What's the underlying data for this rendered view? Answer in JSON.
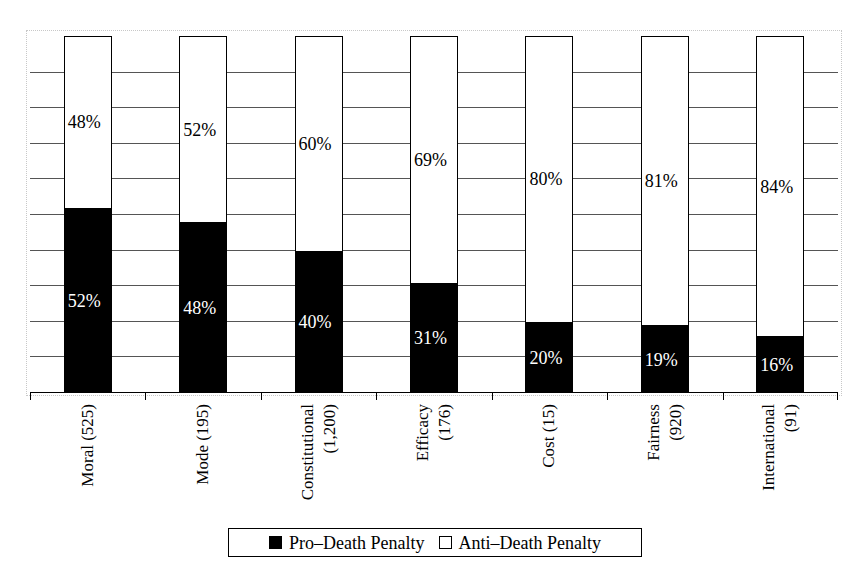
{
  "chart_data": {
    "type": "bar",
    "subtype": "stacked-100-percent",
    "title": "",
    "subtitle": "",
    "xlabel": "",
    "ylabel": "",
    "ylim": [
      0,
      100
    ],
    "grid": true,
    "gridlines": [
      10,
      20,
      30,
      40,
      50,
      60,
      70,
      80,
      90
    ],
    "legend_position": "bottom",
    "orientation": "vertical",
    "categories": [
      "Moral (525)",
      "Mode (195)",
      "Constitutional (1,200)",
      "Efficacy (176)",
      "Cost (15)",
      "Fairness (920)",
      "International (91)"
    ],
    "category_lines": [
      [
        "Moral (525)"
      ],
      [
        "Mode (195)"
      ],
      [
        "Constitutional",
        "(1,200)"
      ],
      [
        "Efficacy",
        "(176)"
      ],
      [
        "Cost (15)"
      ],
      [
        "Fairness",
        "(920)"
      ],
      [
        "International",
        "(91)"
      ]
    ],
    "series": [
      {
        "name": "Pro–Death Penalty",
        "color": "#000000",
        "values": [
          52,
          48,
          40,
          31,
          20,
          19,
          16
        ],
        "labels": [
          "52%",
          "48%",
          "40%",
          "31%",
          "20%",
          "19%",
          "16%"
        ]
      },
      {
        "name": "Anti–Death Penalty",
        "color": "#ffffff",
        "values": [
          48,
          52,
          60,
          69,
          80,
          81,
          84
        ],
        "labels": [
          "48%",
          "52%",
          "60%",
          "69%",
          "80%",
          "81%",
          "84%"
        ]
      }
    ]
  },
  "legend": {
    "entries": [
      {
        "label": "Pro–Death Penalty",
        "swatch": "filled"
      },
      {
        "label": "Anti–Death Penalty",
        "swatch": "hollow"
      }
    ]
  },
  "colors": {
    "pro": "#000000",
    "anti": "#ffffff",
    "gridline": "#555555",
    "axis": "#000000",
    "frame": "#c8c8c8"
  }
}
